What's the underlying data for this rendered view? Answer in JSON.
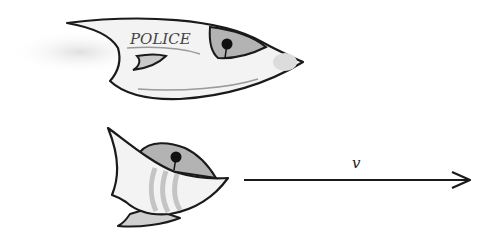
{
  "figure": {
    "top_vehicle": {
      "label": "POLICE",
      "description": "police fish-shaped vehicle"
    },
    "bottom_vehicle": {
      "description": "striped fish-shaped vehicle"
    },
    "velocity_arrow": {
      "label": "v"
    }
  },
  "colors": {
    "outline": "#1a1a1a",
    "body_fill": "#f2f2f2",
    "grey_fill": "#b5b5b5",
    "light_grey": "#d6d6d6",
    "stripe": "#c4c4c4",
    "pupil": "#111111",
    "background": "#ffffff"
  }
}
